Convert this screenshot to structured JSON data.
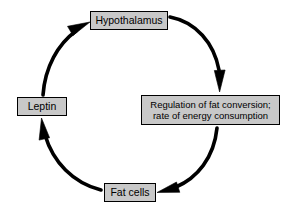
{
  "diagram": {
    "type": "cycle-diagram",
    "direction": "clockwise",
    "canvas": {
      "width": 301,
      "height": 216
    },
    "colors": {
      "background": "#ffffff",
      "node_fill": "#c8c8c8",
      "node_border": "#000000",
      "arrow": "#000000",
      "text": "#000000"
    },
    "nodes": [
      {
        "id": "hypothalamus",
        "label": "Hypothalamus",
        "position": "top"
      },
      {
        "id": "regulation",
        "label": "Regulation of fat conversion;\nrate of energy consumption",
        "position": "right"
      },
      {
        "id": "fat_cells",
        "label": "Fat cells",
        "position": "bottom"
      },
      {
        "id": "leptin",
        "label": "Leptin",
        "position": "left"
      }
    ],
    "edges": [
      {
        "id": "edge-hypothalamus-to-regulation",
        "from": "hypothalamus",
        "to": "regulation",
        "style": "thick curved arrow",
        "arrowhead": "down"
      },
      {
        "id": "edge-regulation-to-fat-cells",
        "from": "regulation",
        "to": "fat_cells",
        "style": "thick curved arrow",
        "arrowhead": "left"
      },
      {
        "id": "edge-fat-cells-to-leptin",
        "from": "fat_cells",
        "to": "leptin",
        "style": "thick curved arrow",
        "arrowhead": "up"
      },
      {
        "id": "edge-leptin-to-hypothalamus",
        "from": "leptin",
        "to": "hypothalamus",
        "style": "thick curved arrow",
        "arrowhead": "up-right"
      }
    ]
  }
}
